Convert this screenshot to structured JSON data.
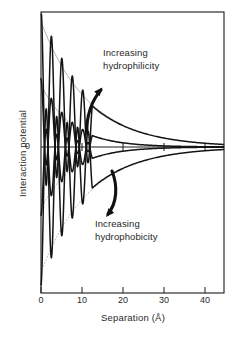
{
  "figure": {
    "background_color": "#ffffff",
    "ink_color": "#1a1a1a"
  },
  "chart_data": {
    "type": "line",
    "title": "",
    "xlabel": "Separation (Å)",
    "ylabel": "Interaction potential",
    "xlim": [
      -1,
      45
    ],
    "ylim": [
      -1,
      1
    ],
    "grid": false,
    "legend_position": "none",
    "x_ticks": [
      0,
      10,
      20,
      30,
      40
    ],
    "x_tick_labels": [
      "0",
      "10",
      "20",
      "30",
      "40"
    ],
    "y_ticks": [
      0
    ],
    "y_tick_labels": [
      "0"
    ],
    "annotations": [
      {
        "id": "hydrophilicity",
        "line1": "Increasing",
        "line2": "hydrophilicity",
        "x": 13,
        "y": 0.72,
        "arrow_direction": "up-right"
      },
      {
        "id": "hydrophobicity",
        "line1": "Increasing",
        "line2": "hydrophobicity",
        "x": 12,
        "y": -0.62,
        "arrow_direction": "down-left"
      }
    ],
    "series": [
      {
        "name": "most-hydrophilic",
        "branch": "repulsive",
        "envelope_sign": 1,
        "envelope_amplitude": 0.93,
        "decay_length": 11.5,
        "oscillation_period": 2.55,
        "oscillation_end": 12.5,
        "description": "Strongly oscillating repulsive hydration force decaying to a long-range repulsive tail"
      },
      {
        "name": "weakly-hydrophilic",
        "branch": "repulsive",
        "envelope_sign": 1,
        "envelope_amplitude": 0.46,
        "decay_length": 7.5,
        "oscillation_period": 2.55,
        "oscillation_end": 12.5,
        "description": "Oscillating repulsive force decaying to a shorter-range repulsive tail"
      },
      {
        "name": "weakly-hydrophobic",
        "branch": "attractive",
        "envelope_sign": -1,
        "envelope_amplitude": 0.46,
        "decay_length": 7.5,
        "oscillation_period": 2.55,
        "oscillation_end": 12.5,
        "description": "Oscillating force decaying to a shorter-range attractive tail"
      },
      {
        "name": "most-hydrophobic",
        "branch": "attractive",
        "envelope_sign": -1,
        "envelope_amplitude": 0.93,
        "decay_length": 11.5,
        "oscillation_period": 2.55,
        "oscillation_end": 12.5,
        "description": "Strongly oscillating force decaying to a long-range attractive tail"
      }
    ],
    "envelope_guides": [
      {
        "name": "upper-envelope-guide",
        "style": "thin",
        "sign": 1,
        "amplitude": 0.93,
        "decay_length": 11.5
      },
      {
        "name": "mid-upper-envelope-guide",
        "style": "thin",
        "sign": 1,
        "amplitude": 0.46,
        "decay_length": 7.5
      },
      {
        "name": "mid-lower-envelope-guide",
        "style": "thin",
        "sign": -1,
        "amplitude": 0.46,
        "decay_length": 7.5
      },
      {
        "name": "lower-envelope-guide",
        "style": "thin",
        "sign": -1,
        "amplitude": 0.93,
        "decay_length": 11.5
      }
    ]
  }
}
